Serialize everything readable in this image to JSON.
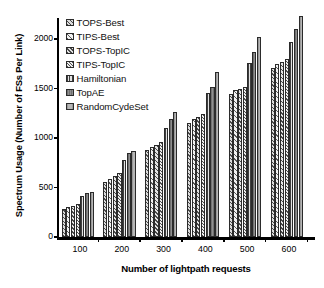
{
  "chart_data": {
    "type": "bar",
    "title": "",
    "xlabel": "Number of lightpath requests",
    "ylabel": "Spectrum Usage (Number of FSs Per Link)",
    "categories": [
      "100",
      "200",
      "300",
      "400",
      "500",
      "600"
    ],
    "ylim": [
      0,
      2300
    ],
    "yticks": [
      0,
      500,
      1000,
      1500,
      2000
    ],
    "ytick_labels": [
      "0",
      "500",
      "1000",
      "1500",
      "2000"
    ],
    "grid": false,
    "legend_position": "upper-left-inside",
    "series": [
      {
        "name": "TOPS-Best",
        "pattern": "diagonal-hatch-dense",
        "values": [
          285,
          560,
          880,
          1150,
          1445,
          1705
        ]
      },
      {
        "name": "TIPS-Best",
        "pattern": "diagonal-hatch-wide",
        "values": [
          300,
          590,
          905,
          1190,
          1480,
          1750
        ]
      },
      {
        "name": "TOPS-TopIC",
        "pattern": "diagonal-hatch-med",
        "values": [
          310,
          620,
          930,
          1215,
          1500,
          1765
        ]
      },
      {
        "name": "TIPS-TopIC",
        "pattern": "diagonal-hatch-fine",
        "values": [
          330,
          645,
          960,
          1240,
          1520,
          1800
        ]
      },
      {
        "name": "Hamiltonian",
        "pattern": "vertical-lines",
        "values": [
          415,
          775,
          1105,
          1450,
          1755,
          1965
        ]
      },
      {
        "name": "TopAE",
        "pattern": "solid-dark-gray",
        "values": [
          440,
          845,
          1195,
          1520,
          1865,
          2105
        ]
      },
      {
        "name": "RandomCycleSet",
        "pattern": "solid-mid-gray",
        "values": [
          455,
          870,
          1265,
          1670,
          2020,
          2230
        ]
      }
    ]
  },
  "legend": {
    "items": [
      {
        "label": "TOPS-Best"
      },
      {
        "label": "TIPS-Best"
      },
      {
        "label": "TOPS-TopIC"
      },
      {
        "label": "TIPS-TopIC"
      },
      {
        "label": "Hamiltonian"
      },
      {
        "label": "TopAE"
      },
      {
        "label": "RandomCydeSet"
      }
    ]
  },
  "colors": {
    "axis": "#000000",
    "bar_outline": "#2b2b2b",
    "background": "#ffffff"
  }
}
